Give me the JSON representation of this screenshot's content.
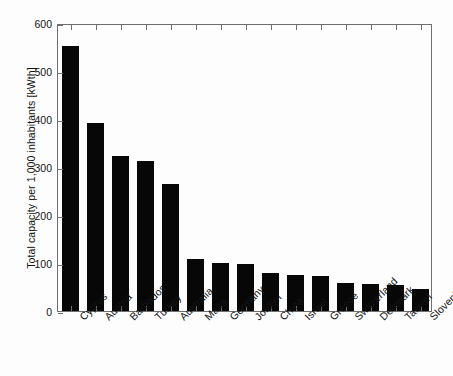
{
  "chart_data": {
    "type": "bar",
    "title": "",
    "xlabel": "",
    "ylabel": "Total capacity per 1,000 inhabitants [kWth]",
    "ylim": [
      0,
      600
    ],
    "yticks": [
      0,
      100,
      200,
      300,
      400,
      500,
      600
    ],
    "ytick_labels": [
      "0",
      "100",
      "200",
      "300",
      "400",
      "500",
      "600"
    ],
    "grid": false,
    "legend": null,
    "bar_color": "#070707",
    "axis_color": "#6f6f6f",
    "categories": [
      "Cyprus",
      "Austria",
      "Barbados",
      "Turkey",
      "Australia",
      "Malta",
      "Germany",
      "Jordan",
      "China",
      "Israel",
      "Greece",
      "Switzerland",
      "Denmark",
      "Taiwan",
      "Slovenia"
    ],
    "values": [
      552,
      391,
      323,
      313,
      264,
      108,
      100,
      98,
      80,
      75,
      73,
      58,
      56,
      54,
      46
    ]
  }
}
